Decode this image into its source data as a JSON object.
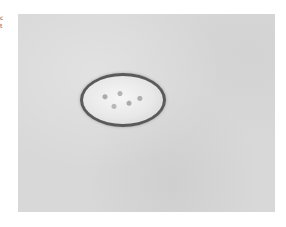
{
  "image": {
    "description": "Micrograph of an oval parasite egg on a gray background",
    "subject": "oval egg with thick dark shell and granular interior",
    "background_color": "#d8d8d8",
    "shell_color": "#5a5a5a"
  },
  "edge_text": [
    "c",
    "t"
  ]
}
